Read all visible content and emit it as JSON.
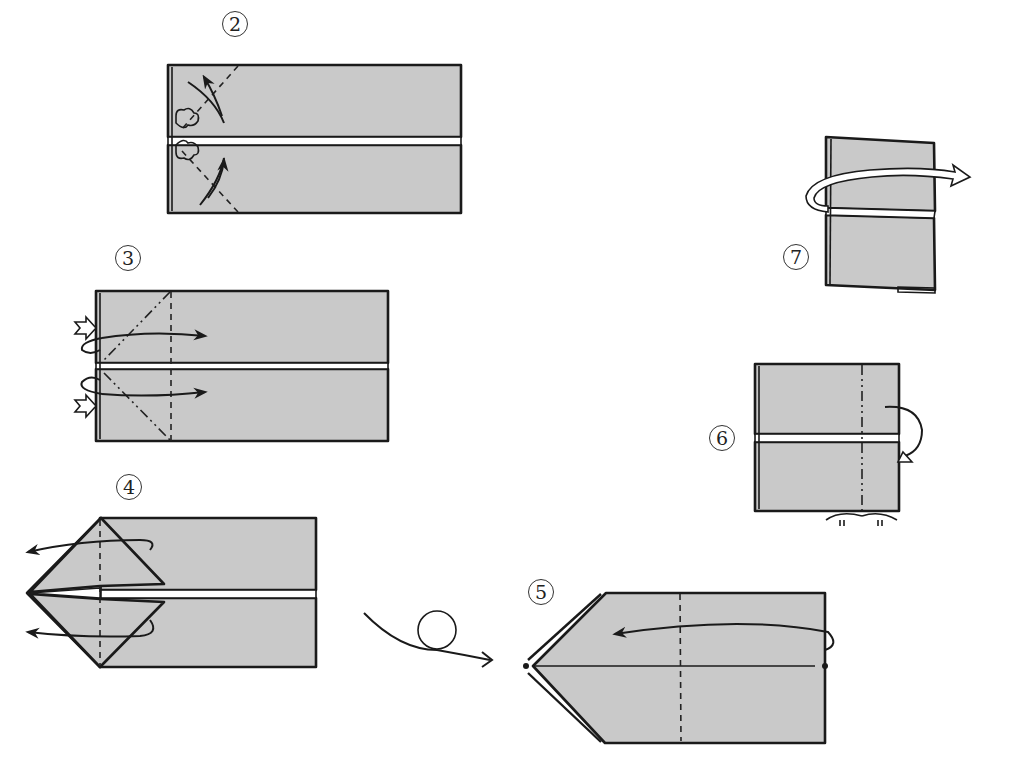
{
  "diagram": {
    "type": "origami-folding-instructions",
    "colors": {
      "paper": "#c9c9c9",
      "line": "#1a1a1a",
      "background": "#ffffff"
    },
    "steps": [
      {
        "id": "step-2",
        "label": "2",
        "actions": [
          "valley-fold corners",
          "fold-and-unfold arrows"
        ]
      },
      {
        "id": "step-3",
        "label": "3",
        "actions": [
          "inside reverse fold corners",
          "push-in arrows",
          "valley fold line"
        ]
      },
      {
        "id": "step-4",
        "label": "4",
        "actions": [
          "fold flaps out to the left"
        ]
      },
      {
        "id": "step-5",
        "label": "5",
        "actions": [
          "turn over",
          "fold right edge to left point",
          "valley fold line"
        ]
      },
      {
        "id": "step-6",
        "label": "6",
        "actions": [
          "mountain fold right section behind",
          "equal distance marks"
        ]
      },
      {
        "id": "step-7",
        "label": "7",
        "actions": [
          "unfold / pull out layer to the right"
        ]
      }
    ],
    "symbols": {
      "turn_over": "turn-over-icon",
      "equal_marks": "equal-distance-icon"
    }
  }
}
